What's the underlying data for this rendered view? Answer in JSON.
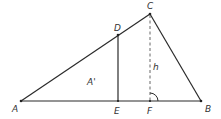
{
  "diagram": {
    "type": "triangle-geometry",
    "points": {
      "A": {
        "label": "A",
        "x": 21,
        "y": 101
      },
      "B": {
        "label": "B",
        "x": 201,
        "y": 101
      },
      "C": {
        "label": "C",
        "x": 150,
        "y": 14
      },
      "D": {
        "label": "D",
        "x": 118,
        "y": 35
      },
      "E": {
        "label": "E",
        "x": 118,
        "y": 101
      },
      "F": {
        "label": "F",
        "x": 150,
        "y": 101
      }
    },
    "segments": [
      {
        "from": "A",
        "to": "B",
        "style": "solid"
      },
      {
        "from": "A",
        "to": "C",
        "style": "solid"
      },
      {
        "from": "C",
        "to": "B",
        "style": "solid"
      },
      {
        "from": "D",
        "to": "E",
        "style": "solid"
      },
      {
        "from": "C",
        "to": "F",
        "style": "dashed"
      }
    ],
    "annotations": {
      "height_label": "h",
      "area_label": "A'",
      "right_angle_at": "F"
    },
    "colors": {
      "line": "#2a2a2a",
      "dashed": "#555555",
      "text": "#333333",
      "background": "#ffffff"
    }
  }
}
